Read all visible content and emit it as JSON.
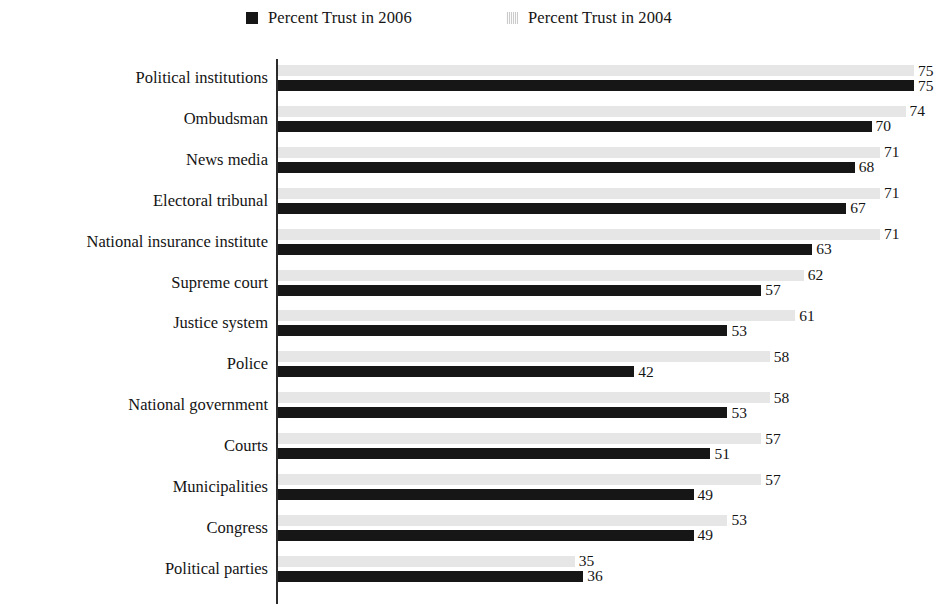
{
  "legend": {
    "entries": [
      {
        "label": "Percent Trust in 2006",
        "color": "#161616",
        "series_key": "2006"
      },
      {
        "label": "Percent Trust in 2004",
        "color": "#e6e6e6",
        "series_key": "2004"
      }
    ]
  },
  "axis": {
    "value_min": 0,
    "value_max": 75,
    "tick_labels_visible": false
  },
  "chart_data": {
    "type": "bar",
    "orientation": "horizontal",
    "title": "",
    "subtitle": "",
    "xlabel": "",
    "ylabel": "",
    "xlim": [
      0,
      75
    ],
    "grid": false,
    "legend_position": "top",
    "data_labels": true,
    "categories": [
      "Political institutions",
      "Ombudsman",
      "News media",
      "Electoral tribunal",
      "National insurance institute",
      "Supreme court",
      "Justice system",
      "Police",
      "National government",
      "Courts",
      "Municipalities",
      "Congress",
      "Political parties"
    ],
    "series": [
      {
        "name": "Percent Trust in 2004",
        "color": "#e6e6e6",
        "values": [
          75,
          74,
          71,
          71,
          71,
          62,
          61,
          58,
          58,
          57,
          57,
          53,
          35
        ]
      },
      {
        "name": "Percent Trust in 2006",
        "color": "#161616",
        "values": [
          75,
          70,
          68,
          67,
          63,
          57,
          53,
          42,
          53,
          51,
          49,
          49,
          36
        ]
      }
    ]
  }
}
